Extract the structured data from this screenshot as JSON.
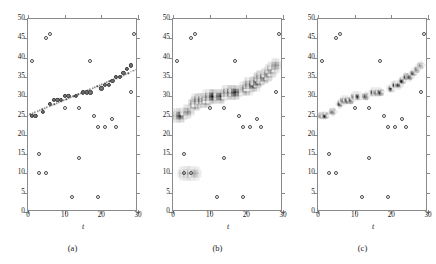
{
  "figure": {
    "type": "three-panel-scatter-figure",
    "panel_count": 3,
    "background": "#ffffff"
  },
  "axes": {
    "xlabel": "t",
    "ylabel": "",
    "xlim": [
      0,
      30
    ],
    "ylim": [
      0,
      50
    ],
    "xticks": [
      0,
      10,
      20,
      30
    ],
    "xticklabels": [
      "0",
      "10",
      "20",
      "30"
    ],
    "yticks": [
      0,
      5,
      10,
      15,
      20,
      25,
      30,
      35,
      40,
      45,
      50
    ],
    "yticklabels": [
      "0",
      "5",
      "10",
      "15",
      "20",
      "25",
      "30",
      "35",
      "40",
      "45",
      "50"
    ],
    "grid": false,
    "box": true,
    "axis_color": "#8a8a8a"
  },
  "captions": {
    "a": "(a)",
    "b": "(b)",
    "c": "(c)"
  },
  "colors": {
    "outlier_stroke": "#4a4a4a",
    "inlier_fill": "#777777",
    "inlier_stroke": "#3a3a3a",
    "fit_line": "#555555",
    "density_dark": "#000000",
    "density_light": "#d8d8d8",
    "axis": "#8a8a8a",
    "text": "#1a1a1a"
  },
  "chart_data": [
    {
      "type": "scatter",
      "title": "(a)",
      "xlabel": "t",
      "ylabel": "",
      "xlim": [
        0,
        30
      ],
      "ylim": [
        0,
        50
      ],
      "grid": false,
      "legend": "none",
      "series": [
        {
          "name": "inliers",
          "marker": "circle-filled",
          "x": [
            1,
            2,
            4,
            6,
            7,
            8,
            9,
            10,
            11,
            13,
            15,
            16,
            17,
            20,
            21,
            22,
            23,
            24,
            25,
            26,
            27,
            28
          ],
          "y": [
            25,
            25,
            26,
            28,
            29,
            29,
            29,
            30,
            30,
            30,
            31,
            31,
            31,
            32,
            33,
            33,
            34,
            35,
            35,
            36,
            37,
            38
          ]
        },
        {
          "name": "outliers",
          "marker": "circle-open",
          "x": [
            1,
            3,
            3,
            5,
            5,
            6,
            10,
            12,
            14,
            14,
            17,
            18,
            19,
            19,
            21,
            23,
            24,
            28,
            29,
            30
          ],
          "y": [
            39,
            10,
            15,
            10,
            45,
            46,
            27,
            4,
            14,
            27,
            39,
            25,
            4,
            22,
            22,
            24,
            22,
            31,
            46,
            6
          ]
        },
        {
          "name": "fitted-line",
          "marker": "dotted-line",
          "x": [
            0,
            30
          ],
          "y": [
            25,
            37
          ]
        }
      ]
    },
    {
      "type": "scatter",
      "title": "(b)",
      "xlabel": "t",
      "ylabel": "",
      "xlim": [
        0,
        30
      ],
      "ylim": [
        0,
        50
      ],
      "grid": false,
      "legend": "none",
      "description": "same data overlaid with a diffuse grayscale posterior density cloud around the trend, plus a faint secondary cloud near y=10",
      "series": [
        {
          "name": "density-primary",
          "marker": "grayscale-square",
          "x": [
            1,
            2,
            4,
            6,
            7,
            8,
            9,
            10,
            11,
            13,
            15,
            16,
            17,
            20,
            21,
            22,
            23,
            24,
            25,
            26,
            27,
            28
          ],
          "y": [
            25,
            25,
            26,
            28,
            29,
            29,
            29,
            30,
            30,
            30,
            31,
            31,
            31,
            32,
            33,
            33,
            34,
            35,
            35,
            36,
            37,
            38
          ],
          "intensity": [
            0.55,
            0.75,
            0.5,
            0.8,
            0.95,
            0.85,
            0.8,
            0.9,
            0.95,
            0.85,
            0.9,
            0.95,
            0.85,
            0.95,
            0.9,
            0.95,
            0.85,
            0.8,
            0.75,
            0.7,
            0.6,
            0.5
          ]
        },
        {
          "name": "density-secondary",
          "marker": "grayscale-square",
          "x": [
            3,
            4,
            5,
            6
          ],
          "y": [
            10,
            10,
            10,
            10
          ],
          "intensity": [
            0.4,
            0.5,
            0.6,
            0.35
          ]
        },
        {
          "name": "outliers",
          "marker": "circle-open",
          "x": [
            1,
            3,
            3,
            5,
            5,
            6,
            10,
            12,
            14,
            14,
            17,
            18,
            19,
            19,
            21,
            23,
            24,
            28,
            29,
            30
          ],
          "y": [
            39,
            10,
            15,
            10,
            45,
            46,
            27,
            4,
            14,
            27,
            39,
            25,
            4,
            22,
            22,
            24,
            22,
            31,
            46,
            6
          ]
        }
      ]
    },
    {
      "type": "scatter",
      "title": "(c)",
      "xlabel": "t",
      "ylabel": "",
      "xlim": [
        0,
        30
      ],
      "ylim": [
        0,
        50
      ],
      "grid": false,
      "legend": "none",
      "description": "same data with a tighter, darker grayscale density band concentrated on the trend",
      "series": [
        {
          "name": "density-primary",
          "marker": "grayscale-square",
          "x": [
            1,
            2,
            4,
            6,
            7,
            8,
            9,
            10,
            11,
            13,
            15,
            16,
            17,
            20,
            21,
            22,
            23,
            24,
            25,
            26,
            27,
            28
          ],
          "y": [
            25,
            25,
            26,
            28,
            29,
            29,
            29,
            30,
            30,
            30,
            31,
            31,
            31,
            32,
            33,
            33,
            34,
            35,
            35,
            36,
            37,
            38
          ],
          "intensity": [
            0.7,
            0.9,
            0.7,
            0.95,
            1.0,
            0.95,
            0.9,
            1.0,
            1.0,
            0.95,
            1.0,
            1.0,
            0.95,
            1.0,
            1.0,
            1.0,
            0.95,
            0.9,
            0.9,
            0.85,
            0.7,
            0.6
          ]
        },
        {
          "name": "outliers",
          "marker": "circle-open",
          "x": [
            1,
            3,
            3,
            5,
            5,
            6,
            10,
            12,
            14,
            14,
            17,
            18,
            19,
            19,
            21,
            23,
            24,
            28,
            29,
            30
          ],
          "y": [
            39,
            10,
            15,
            10,
            45,
            46,
            27,
            4,
            14,
            27,
            39,
            25,
            4,
            22,
            22,
            24,
            22,
            31,
            46,
            6
          ]
        }
      ]
    }
  ]
}
